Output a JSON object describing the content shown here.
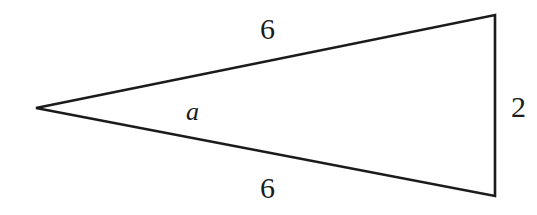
{
  "figure": {
    "kind": "geometry-diagram",
    "shape": "isosceles-triangle",
    "background_color": "#ffffff",
    "stroke_color": "#1b1b1b",
    "stroke_width": 2.6,
    "width": 537,
    "height": 215
  },
  "vertices": {
    "apex_left": {
      "x": 36,
      "y": 108
    },
    "top_right": {
      "x": 495,
      "y": 15
    },
    "bottom_right": {
      "x": 495,
      "y": 196
    }
  },
  "labels": {
    "side_top": "6",
    "side_bottom": "6",
    "side_right": "2",
    "angle_a": "a"
  },
  "label_positions": {
    "side_top": {
      "x": 260,
      "y": 14
    },
    "side_bottom": {
      "x": 260,
      "y": 173
    },
    "side_right": {
      "x": 511,
      "y": 92
    },
    "angle_a": {
      "x": 186,
      "y": 99
    }
  },
  "chart_data": {
    "type": "diagram",
    "title": "",
    "edges": [
      {
        "name": "upper-side",
        "from": "apex_left",
        "to": "top_right",
        "label": "6"
      },
      {
        "name": "lower-side",
        "from": "apex_left",
        "to": "bottom_right",
        "label": "6"
      },
      {
        "name": "vertical-base",
        "from": "top_right",
        "to": "bottom_right",
        "label": "2"
      }
    ],
    "angles": [
      {
        "name": "apex-angle",
        "at": "apex_left",
        "label": "a"
      }
    ]
  }
}
